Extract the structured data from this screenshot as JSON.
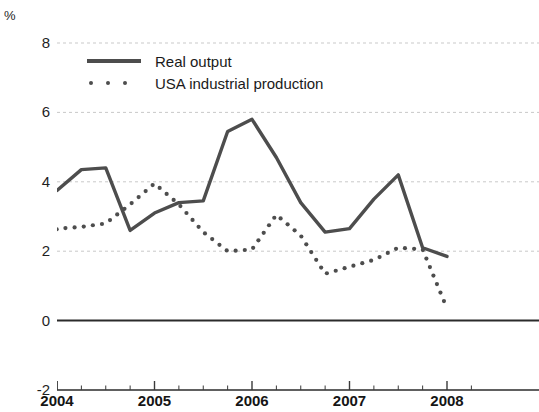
{
  "chart_data": {
    "type": "line",
    "title": "",
    "xlabel": "",
    "ylabel": "%",
    "ylim": [
      -2,
      8
    ],
    "yticks": [
      8,
      6,
      4,
      2,
      0,
      -2
    ],
    "xlim": [
      2003.75,
      2008.25
    ],
    "xticks": [
      "2004",
      "2005",
      "2006",
      "2007",
      "2008"
    ],
    "xtick_values": [
      2004,
      2005,
      2006,
      2007,
      2008
    ],
    "minor_ticks_per_interval": 4,
    "grid": "horizontal dashed at y = 8, 6, 4, 2, 2; solid zero line at y = 0",
    "legend_position": "upper left inside plot",
    "series": [
      {
        "name": "Real output",
        "style": "solid",
        "color": "#4d4d4d",
        "x": [
          2003.75,
          2004.0,
          2004.25,
          2004.5,
          2004.75,
          2005.0,
          2005.25,
          2005.5,
          2005.75,
          2006.0,
          2006.25,
          2006.5,
          2006.75,
          2007.0,
          2007.25,
          2007.5,
          2007.75,
          2008.0
        ],
        "values": [
          3.4,
          3.75,
          4.35,
          4.4,
          2.6,
          3.1,
          3.4,
          3.45,
          5.45,
          5.8,
          4.7,
          3.4,
          2.55,
          2.65,
          3.5,
          4.2,
          2.1,
          1.85
        ]
      },
      {
        "name": "USA industrial production",
        "style": "dotted",
        "color": "#4d4d4d",
        "x": [
          2003.75,
          2004.0,
          2004.25,
          2004.5,
          2004.75,
          2005.0,
          2005.25,
          2005.5,
          2005.75,
          2006.0,
          2006.25,
          2006.5,
          2006.75,
          2007.0,
          2007.25,
          2007.5,
          2007.75,
          2008.0
        ],
        "values": [
          1.5,
          2.65,
          2.7,
          2.8,
          3.35,
          3.95,
          3.35,
          2.55,
          2.0,
          2.05,
          3.05,
          2.45,
          1.35,
          1.55,
          1.75,
          2.1,
          2.05,
          0.35
        ]
      }
    ]
  },
  "axis": {
    "unit_label": "%"
  },
  "legend": {
    "items": [
      {
        "label": "Real output",
        "style": "solid"
      },
      {
        "label": "USA industrial production",
        "style": "dotted"
      }
    ]
  }
}
